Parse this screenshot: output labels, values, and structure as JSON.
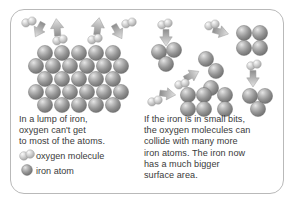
{
  "figure": {
    "border_color": "#b9b9b9",
    "background": "#ffffff",
    "text_color": "#3a3a3a"
  },
  "panels": {
    "left": {
      "name": "lump-of-iron-panel",
      "caption": "In a lump of iron,\noxygen can't get\nto most of the atoms.",
      "lattice": {
        "description": "close-packed block of iron atoms",
        "rows": [
          5,
          6,
          5,
          6,
          5
        ],
        "atom_count": 27
      },
      "oxygen_molecules": 4,
      "arrows": [
        {
          "name": "arrow-incoming-left",
          "direction": "down-right"
        },
        {
          "name": "arrow-bounce-left",
          "direction": "up"
        },
        {
          "name": "arrow-bounce-right",
          "direction": "up"
        },
        {
          "name": "arrow-incoming-right",
          "direction": "down-left"
        }
      ]
    },
    "right": {
      "name": "small-bits-of-iron-panel",
      "caption": "If the iron is in small bits,\nthe oxygen molecules can\ncollide with many more\niron atoms. The iron now\nhas a much bigger\nsurface area.",
      "clusters": [
        {
          "name": "cluster-top-left",
          "atoms": 3
        },
        {
          "name": "cluster-middle",
          "atoms": 2
        },
        {
          "name": "cluster-top-right",
          "atoms": 4
        },
        {
          "name": "cluster-bottom-left",
          "atoms": 4
        },
        {
          "name": "cluster-bottom-middle",
          "atoms": 2
        },
        {
          "name": "cluster-bottom-right",
          "atoms": 3
        }
      ],
      "oxygen_molecules": 5,
      "arrows": [
        {
          "name": "arrow-down-topleft",
          "direction": "down"
        },
        {
          "name": "arrow-right-upper",
          "direction": "right"
        },
        {
          "name": "arrow-upright-middle",
          "direction": "up-right"
        },
        {
          "name": "arrow-right-lower",
          "direction": "right"
        },
        {
          "name": "arrow-down-right",
          "direction": "down"
        }
      ]
    }
  },
  "legend": {
    "name": "legend",
    "items": [
      {
        "key": "oxygen-molecule",
        "label": "oxygen molecule",
        "shape": "two-joined-spheres",
        "color": "#c9c9c9"
      },
      {
        "key": "iron-atom",
        "label": "iron atom",
        "shape": "single-sphere",
        "color": "#8f8f8f"
      }
    ]
  },
  "colors": {
    "iron_atom": "#8f8f8f",
    "iron_atom_light": "#d8d8d8",
    "iron_atom_dark": "#6a6a6a",
    "oxygen_atom": "#cfcfcf",
    "oxygen_atom_light": "#f2f2f2",
    "oxygen_atom_dark": "#9d9d9d",
    "arrow": "#b0b0b0",
    "text": "#3a3a3a",
    "border": "#b9b9b9"
  }
}
